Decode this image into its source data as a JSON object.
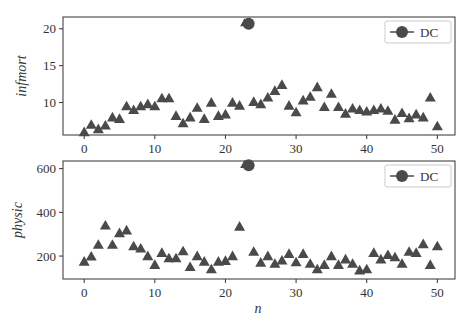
{
  "chart_data": [
    {
      "type": "scatter",
      "title": "",
      "xlabel": "",
      "ylabel": "infmort",
      "xlim": [
        -3,
        52.5
      ],
      "ylim": [
        5.6,
        21.6
      ],
      "xticks": [
        0,
        10,
        20,
        30,
        40,
        50
      ],
      "yticks": [
        10,
        15,
        20
      ],
      "grid": false,
      "legend": {
        "position": "upper right",
        "entries": [
          "DC"
        ]
      },
      "series": [
        {
          "name": "states",
          "marker": "triangle",
          "x": [
            0,
            1,
            2,
            3,
            4,
            5,
            6,
            7,
            8,
            9,
            10,
            11,
            12,
            13,
            14,
            15,
            16,
            17,
            18,
            19,
            20,
            21,
            22,
            24,
            25,
            26,
            27,
            28,
            29,
            30,
            31,
            32,
            33,
            34,
            35,
            36,
            37,
            38,
            39,
            40,
            41,
            42,
            43,
            44,
            45,
            46,
            47,
            48,
            49,
            50
          ],
          "values": [
            6.0,
            7.0,
            6.4,
            6.9,
            8.0,
            7.8,
            9.5,
            9.0,
            9.5,
            9.8,
            9.5,
            10.6,
            10.6,
            8.2,
            7.2,
            8.0,
            9.3,
            7.8,
            10.0,
            8.2,
            8.4,
            10.0,
            9.6,
            10.1,
            9.8,
            10.7,
            11.6,
            12.4,
            9.6,
            8.7,
            10.3,
            10.8,
            12.1,
            9.4,
            11.2,
            9.4,
            8.5,
            9.2,
            9.0,
            8.8,
            9.0,
            9.2,
            8.9,
            7.7,
            8.6,
            7.9,
            8.4,
            8.0,
            10.7,
            6.8
          ]
        },
        {
          "name": "DC",
          "marker": "circle",
          "x": [
            23
          ],
          "values": [
            20.7
          ]
        }
      ]
    },
    {
      "type": "scatter",
      "title": "",
      "xlabel": "n",
      "ylabel": "physic",
      "xlim": [
        -3,
        52.5
      ],
      "ylim": [
        95,
        635
      ],
      "xticks": [
        0,
        10,
        20,
        30,
        40,
        50
      ],
      "yticks": [
        200,
        400,
        600
      ],
      "grid": false,
      "legend": {
        "position": "upper right",
        "entries": [
          "DC"
        ]
      },
      "series": [
        {
          "name": "states",
          "marker": "triangle",
          "x": [
            0,
            1,
            2,
            3,
            4,
            5,
            6,
            7,
            8,
            9,
            10,
            11,
            12,
            13,
            14,
            15,
            16,
            17,
            18,
            19,
            20,
            21,
            22,
            24,
            25,
            26,
            27,
            28,
            29,
            30,
            31,
            32,
            33,
            34,
            35,
            36,
            37,
            38,
            39,
            40,
            41,
            42,
            43,
            44,
            45,
            46,
            47,
            48,
            49,
            50
          ],
          "values": [
            175,
            198,
            252,
            340,
            252,
            305,
            318,
            245,
            235,
            200,
            160,
            215,
            190,
            190,
            222,
            150,
            200,
            175,
            140,
            175,
            178,
            200,
            335,
            220,
            170,
            200,
            165,
            180,
            210,
            172,
            210,
            165,
            140,
            160,
            200,
            160,
            185,
            165,
            135,
            140,
            215,
            185,
            205,
            195,
            165,
            220,
            215,
            255,
            160,
            245
          ]
        },
        {
          "name": "DC",
          "marker": "circle",
          "x": [
            23
          ],
          "values": [
            615
          ]
        }
      ]
    }
  ],
  "labels": {
    "top_ylabel": "infmort",
    "bottom_ylabel": "physic",
    "xlabel": "n",
    "legend_entry": "DC",
    "xticks": [
      "0",
      "10",
      "20",
      "30",
      "40",
      "50"
    ],
    "top_yticks": [
      "10",
      "15",
      "20"
    ],
    "bottom_yticks": [
      "200",
      "400",
      "600"
    ]
  },
  "colors": {
    "marker": "#4a4a4a",
    "axes": "#333333",
    "legend_border": "#cccccc"
  }
}
